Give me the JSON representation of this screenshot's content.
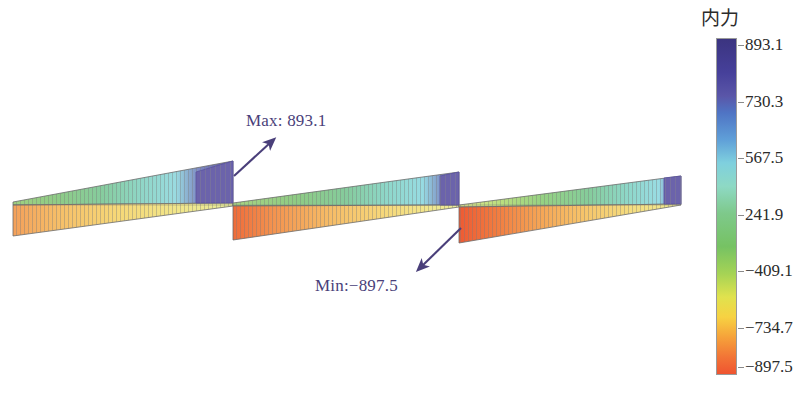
{
  "figure": {
    "caption": ""
  },
  "annotations": {
    "max": {
      "label": "Max: 893.1",
      "value": 893.1,
      "color": "#4a3f7a"
    },
    "min": {
      "label": "Min:−897.5",
      "value": -897.5,
      "color": "#4a3f7a"
    }
  },
  "legend": {
    "title": "内力",
    "title_meaning": "internal force",
    "ticks": [
      {
        "label": "893.1",
        "value": 893.1,
        "pos": 0.022
      },
      {
        "label": "730.3",
        "value": 730.3,
        "pos": 0.19
      },
      {
        "label": "567.5",
        "value": 567.5,
        "pos": 0.357
      },
      {
        "label": "241.9",
        "value": 241.9,
        "pos": 0.525
      },
      {
        "label": "−409.1",
        "value": -409.1,
        "pos": 0.692
      },
      {
        "label": "−734.7",
        "value": -734.7,
        "pos": 0.86
      },
      {
        "label": "−897.5",
        "value": -897.5,
        "pos": 0.975
      }
    ],
    "colors": [
      {
        "stop": 0.0,
        "hex": "#3b3480"
      },
      {
        "stop": 0.1,
        "hex": "#46409a"
      },
      {
        "stop": 0.17,
        "hex": "#5a56a8"
      },
      {
        "stop": 0.22,
        "hex": "#4f74c4"
      },
      {
        "stop": 0.3,
        "hex": "#5f9fd8"
      },
      {
        "stop": 0.37,
        "hex": "#7fd0de"
      },
      {
        "stop": 0.44,
        "hex": "#8ed9c4"
      },
      {
        "stop": 0.52,
        "hex": "#7ec98b"
      },
      {
        "stop": 0.62,
        "hex": "#76c263"
      },
      {
        "stop": 0.7,
        "hex": "#a5d355"
      },
      {
        "stop": 0.77,
        "hex": "#e0e24e"
      },
      {
        "stop": 0.83,
        "hex": "#f7d242"
      },
      {
        "stop": 0.89,
        "hex": "#f6a23a"
      },
      {
        "stop": 0.95,
        "hex": "#f27436"
      },
      {
        "stop": 1.0,
        "hex": "#ef5430"
      }
    ]
  },
  "chart_data": {
    "type": "area",
    "title": "",
    "subtitle": "",
    "xlabel": "",
    "ylabel": "内力",
    "colormap": "jet-reversed (purple=high → red=low)",
    "value_range": [
      -897.5,
      893.1
    ],
    "legend_position": "right",
    "grid": false,
    "baseline_y": 205,
    "spans": [
      {
        "name": "span-1",
        "x_start": 13,
        "x_end": 233,
        "support_left": 13,
        "support_right": 233,
        "positive_peak_value": 893.1,
        "positive_peak_x": 233,
        "negative_peak_value": -700,
        "negative_peak_x": 13
      },
      {
        "name": "span-2",
        "x_start": 233,
        "x_end": 459,
        "support_left": 233,
        "support_right": 459,
        "positive_peak_value": 860,
        "positive_peak_x": 459,
        "negative_peak_value": -880,
        "negative_peak_x": 233
      },
      {
        "name": "span-3",
        "x_start": 459,
        "x_end": 681,
        "support_left": 459,
        "support_right": 681,
        "positive_peak_value": 830,
        "positive_peak_x": 681,
        "negative_peak_value": -897.5,
        "negative_peak_x": 459
      }
    ],
    "series": [
      {
        "name": "internal force envelope (top / positive side)",
        "x": [
          13,
          60,
          110,
          160,
          200,
          225,
          233,
          280,
          330,
          380,
          420,
          450,
          459,
          500,
          550,
          600,
          640,
          670,
          681
        ],
        "values": [
          40,
          130,
          230,
          330,
          420,
          480,
          893.1,
          120,
          220,
          330,
          430,
          520,
          860,
          110,
          230,
          360,
          490,
          620,
          830
        ]
      },
      {
        "name": "internal force envelope (bottom / negative side)",
        "x": [
          13,
          60,
          110,
          160,
          200,
          225,
          233,
          280,
          330,
          380,
          420,
          450,
          459,
          500,
          550,
          600,
          640,
          670,
          681
        ],
        "values": [
          -700,
          -600,
          -470,
          -340,
          -230,
          -150,
          -880,
          -720,
          -560,
          -400,
          -260,
          -150,
          -897.5,
          -740,
          -560,
          -390,
          -250,
          -140,
          -60
        ]
      }
    ]
  }
}
